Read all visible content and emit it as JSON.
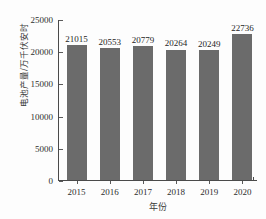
{
  "chart_data": {
    "type": "bar",
    "title": "",
    "xlabel": "年份",
    "ylabel": "电池产量/万千伏安时",
    "categories": [
      "2015",
      "2016",
      "2017",
      "2018",
      "2019",
      "2020"
    ],
    "values": [
      21015,
      20553,
      20779,
      20264,
      20249,
      22736
    ],
    "value_labels": [
      "21015",
      "20553",
      "20779",
      "20264",
      "20249",
      "22736"
    ],
    "ylim": [
      0,
      25000
    ],
    "yticks": [
      0,
      5000,
      10000,
      15000,
      20000,
      25000
    ],
    "ytick_labels": [
      "0",
      "5000",
      "10000",
      "15000",
      "20000",
      "25000"
    ],
    "grid": false,
    "legend": false,
    "series": [
      {
        "name": "电池产量",
        "values": [
          21015,
          20553,
          20779,
          20264,
          20249,
          22736
        ],
        "color": "#6b6b6b"
      }
    ]
  },
  "style": {
    "bar_color": "#6b6b6b",
    "axis_color": "#4a4a4a",
    "text_color": "#2e2e2e",
    "background": "#fdfdfd"
  }
}
